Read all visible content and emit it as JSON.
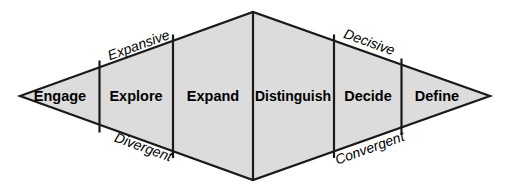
{
  "diagram": {
    "shape": "diamond",
    "fill_color": "#dcdcdc",
    "stroke_color": "#1a1a1a",
    "stages": [
      {
        "label": "Engage",
        "order": 1
      },
      {
        "label": "Explore",
        "order": 2
      },
      {
        "label": "Expand",
        "order": 3
      },
      {
        "label": "Distinguish",
        "order": 4
      },
      {
        "label": "Decide",
        "order": 5
      },
      {
        "label": "Define",
        "order": 6
      }
    ],
    "edge_labels": {
      "top_left": "Expansive",
      "top_right": "Decisive",
      "bottom_left": "Divergent",
      "bottom_right": "Convergent"
    }
  }
}
